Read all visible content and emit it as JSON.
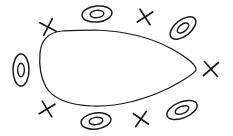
{
  "figure": {
    "type": "sketch-diagram",
    "canvas": {
      "width": 233,
      "height": 136
    },
    "background_color": "#ffffff",
    "ink_color": "#1b1b1b"
  },
  "boundary": {
    "name": "closed-egg-curve",
    "description": "Hand-drawn closed teardrop/egg outline, blunt and rounded on the left, tapering to a rounded point on the right",
    "stroke_color": "#1b1b1b",
    "stroke_width": 1.25,
    "bounds": {
      "x": 38,
      "y": 29,
      "width": 160,
      "height": 78
    },
    "path": "M 62 31 C 48 32 41 41 40 53 C 39 64 40 76 46 87 C 53 99 69 105 92 106 C 118 107 146 99 169 88 C 184 80 194 74 196 70 C 197 66 188 58 172 49 C 150 37 124 31 96 30 C 84 30 70 30 62 31 Z"
  },
  "markers": [
    {
      "id": "oval-left",
      "kind": "concentric-oval",
      "label": "O",
      "cx": 21,
      "cy": 70,
      "rx": 8,
      "ry": 16,
      "inner_scale": 0.42,
      "rotation_deg": 0
    },
    {
      "id": "oval-top-center",
      "kind": "concentric-oval",
      "label": "O",
      "cx": 97,
      "cy": 14,
      "rx": 15,
      "ry": 8,
      "inner_scale": 0.46,
      "rotation_deg": -6
    },
    {
      "id": "oval-top-right",
      "kind": "concentric-oval",
      "label": "O",
      "cx": 183,
      "cy": 28,
      "rx": 15,
      "ry": 8,
      "inner_scale": 0.45,
      "rotation_deg": -38
    },
    {
      "id": "oval-bottom-center",
      "kind": "concentric-oval",
      "label": "O",
      "cx": 96,
      "cy": 121,
      "rx": 15,
      "ry": 8,
      "inner_scale": 0.46,
      "rotation_deg": -8
    },
    {
      "id": "oval-bottom-right",
      "kind": "concentric-oval",
      "label": "O",
      "cx": 182,
      "cy": 110,
      "rx": 16,
      "ry": 8,
      "inner_scale": 0.45,
      "rotation_deg": -22
    },
    {
      "id": "cross-top-left",
      "kind": "x-cross",
      "label": "X",
      "cx": 48,
      "cy": 27,
      "size": 13,
      "rotation_deg": -18
    },
    {
      "id": "cross-top-center-right",
      "kind": "x-cross",
      "label": "X",
      "cx": 145,
      "cy": 17,
      "size": 13,
      "rotation_deg": 12
    },
    {
      "id": "cross-right",
      "kind": "x-cross",
      "label": "X",
      "cx": 211,
      "cy": 69,
      "size": 14,
      "rotation_deg": 4
    },
    {
      "id": "cross-bottom-left",
      "kind": "x-cross",
      "label": "X",
      "cx": 47,
      "cy": 109,
      "size": 13,
      "rotation_deg": 14
    },
    {
      "id": "cross-bottom-center-right",
      "kind": "x-cross",
      "label": "X",
      "cx": 141,
      "cy": 119,
      "size": 13,
      "rotation_deg": -10
    }
  ]
}
